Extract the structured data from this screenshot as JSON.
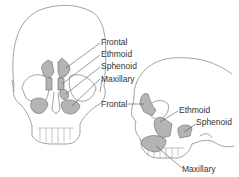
{
  "diagram": {
    "colors": {
      "sinus_fill": "#b4b4b4",
      "outline": "#777777",
      "leader": "#555555",
      "text": "#333333"
    },
    "front_view": {
      "labels": [
        {
          "id": "frontal",
          "text": "Frontal"
        },
        {
          "id": "ethmoid",
          "text": "Ethmoid"
        },
        {
          "id": "sphenoid",
          "text": "Sphenoid"
        },
        {
          "id": "maxillary",
          "text": "Maxillary"
        }
      ]
    },
    "side_view": {
      "labels": [
        {
          "id": "frontal",
          "text": "Frontal"
        },
        {
          "id": "ethmoid",
          "text": "Ethmoid"
        },
        {
          "id": "sphenoid",
          "text": "Sphenoid"
        },
        {
          "id": "maxillary",
          "text": "Maxillary"
        }
      ]
    }
  }
}
